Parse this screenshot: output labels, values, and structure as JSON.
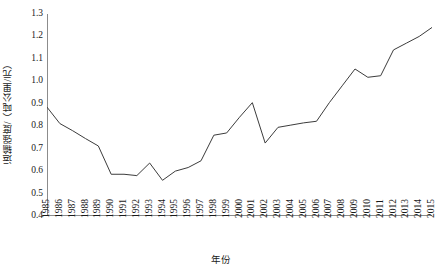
{
  "chart_data": {
    "type": "line",
    "title": "",
    "xlabel": "年份",
    "ylabel": "运输强度/（吨公里/元）",
    "categories": [
      "1985",
      "1986",
      "1987",
      "1988",
      "1989",
      "1990",
      "1991",
      "1992",
      "1993",
      "1994",
      "1995",
      "1996",
      "1997",
      "1998",
      "1999",
      "2000",
      "2001",
      "2002",
      "2003",
      "2004",
      "2005",
      "2006",
      "2007",
      "2008",
      "2009",
      "2010",
      "2011",
      "2012",
      "2013",
      "2014",
      "2015"
    ],
    "values": [
      0.885,
      0.812,
      0.78,
      0.745,
      0.712,
      0.586,
      0.586,
      0.58,
      0.636,
      0.559,
      0.6,
      0.616,
      0.646,
      0.76,
      0.77,
      0.84,
      0.905,
      0.725,
      0.795,
      0.805,
      0.815,
      0.822,
      0.905,
      0.98,
      1.055,
      1.018,
      1.025,
      1.14,
      1.17,
      1.2,
      1.24
    ],
    "ylim": [
      0.4,
      1.3
    ],
    "ytick_labels": [
      "0.4",
      "0.5",
      "0.6",
      "0.7",
      "0.8",
      "0.9",
      "1.0",
      "1.1",
      "1.2",
      "1.3"
    ],
    "ytick_values": [
      0.4,
      0.5,
      0.6,
      0.7,
      0.8,
      0.9,
      1.0,
      1.1,
      1.2,
      1.3
    ],
    "grid": false,
    "legend": false,
    "legend_position": "none",
    "line_color": "#3c3c3c",
    "axis_color": "#8c8c8c",
    "series_name": "运输强度"
  }
}
